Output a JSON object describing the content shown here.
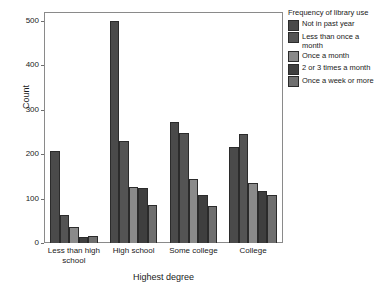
{
  "chart_data": {
    "type": "bar",
    "title": "",
    "xlabel": "Highest degree",
    "ylabel": "Count",
    "categories": [
      "Less than high school",
      "High school",
      "Some college",
      "College"
    ],
    "legend_title": "Frequency of library use",
    "legend_position": "right",
    "grid": false,
    "ylim": [
      0,
      520
    ],
    "yticks": [
      0,
      100,
      200,
      300,
      400,
      500
    ],
    "ytick_labels": [
      "0",
      "100",
      "200",
      "300",
      "400",
      "500"
    ],
    "series": [
      {
        "name": "Not in past year",
        "color": "#4a4a4a",
        "values": [
          208,
          500,
          272,
          217
        ]
      },
      {
        "name": "Less than once a month",
        "color": "#545454",
        "values": [
          64,
          230,
          248,
          245
        ]
      },
      {
        "name": "Once a month",
        "color": "#8a8a8a",
        "values": [
          35,
          125,
          145,
          135
        ]
      },
      {
        "name": "2 or 3 times a month",
        "color": "#3f3f3f",
        "values": [
          14,
          123,
          107,
          117
        ]
      },
      {
        "name": "Once a week or more",
        "color": "#6f6f6f",
        "values": [
          15,
          85,
          84,
          109
        ]
      }
    ]
  },
  "axis": {
    "y_label": "Count",
    "x_label": "Highest degree"
  },
  "legend": {
    "title": "Frequency of library use"
  }
}
